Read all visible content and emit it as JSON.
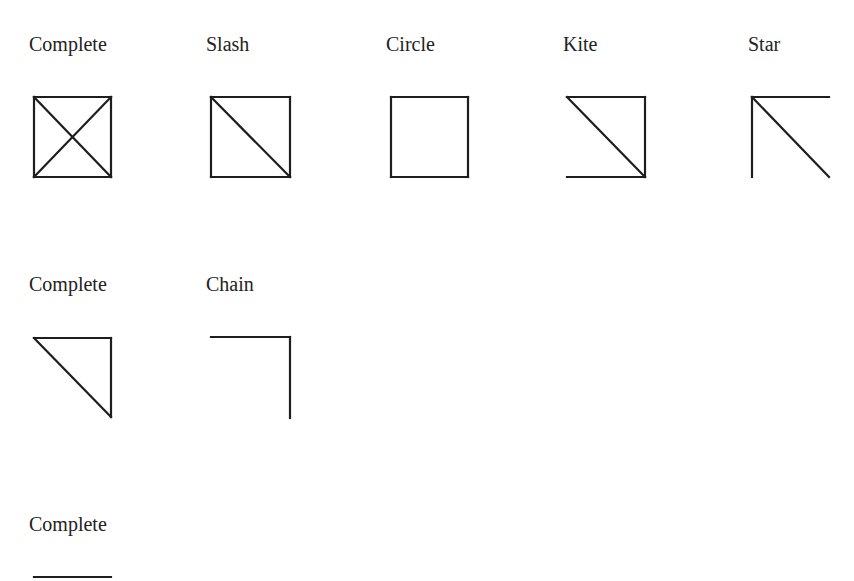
{
  "rows": [
    {
      "items": [
        {
          "label": "Complete",
          "shape": "complete-4"
        },
        {
          "label": "Slash",
          "shape": "slash"
        },
        {
          "label": "Circle",
          "shape": "circle"
        },
        {
          "label": "Kite",
          "shape": "kite"
        },
        {
          "label": "Star",
          "shape": "star"
        }
      ]
    },
    {
      "items": [
        {
          "label": "Complete",
          "shape": "complete-3"
        },
        {
          "label": "Chain",
          "shape": "chain"
        }
      ]
    },
    {
      "items": [
        {
          "label": "Complete",
          "shape": "complete-2"
        }
      ]
    }
  ],
  "colors": {
    "stroke": "#1e1e1e",
    "text": "#222222",
    "background": "#ffffff"
  }
}
